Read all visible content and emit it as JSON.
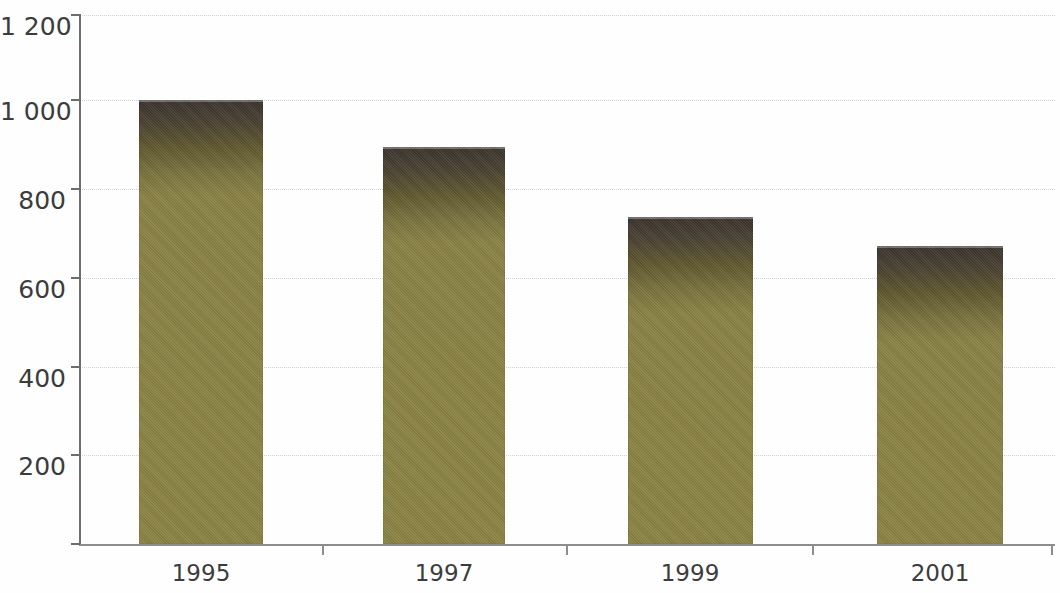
{
  "chart_data": {
    "type": "bar",
    "title": "",
    "subtitle": "",
    "xlabel": "",
    "ylabel": "",
    "categories": [
      "1995",
      "1997",
      "1999",
      "2001"
    ],
    "values": [
      1007,
      901,
      741,
      676
    ],
    "series": [
      {
        "name": "",
        "values": [
          1007,
          901,
          741,
          676
        ]
      }
    ],
    "ylim": [
      0,
      1200
    ],
    "y_ticks": [
      200,
      400,
      600,
      800,
      1000,
      1200
    ],
    "y_tick_labels": [
      "200",
      "400",
      "600",
      "800",
      "1 000",
      "1 200"
    ],
    "x_tick_labels": [
      "1995",
      "1997",
      "1999",
      "2001"
    ],
    "grid": true,
    "grid_axis": "y",
    "legend": false,
    "legend_position": "none",
    "annotations": [],
    "colors": {
      "bar_top": "#3b342e",
      "bar_bottom": "#8b8345",
      "gridline": "#cfcfcf",
      "axis": "#6d6d6d",
      "x_axis": "#8d8d8d",
      "tick_label": "#3c3c3c",
      "background": "#fefefe"
    }
  }
}
